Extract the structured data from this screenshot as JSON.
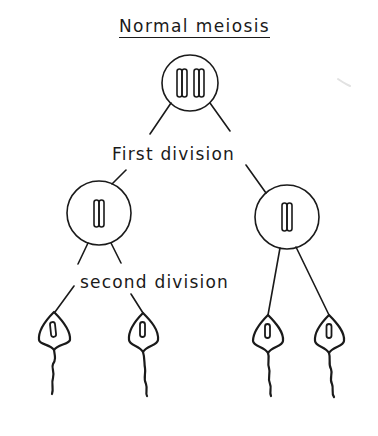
{
  "title": "Normal meiosis",
  "labels": {
    "first_division": "First division",
    "second_division": "second division"
  },
  "nodes": [
    {
      "id": "parent-cell",
      "stage": "before meiosis",
      "chromosome_pairs": 2,
      "cx": 190,
      "cy": 83,
      "r": 28
    },
    {
      "id": "daughter-cell-left",
      "stage": "after first division",
      "chromosome_pairs": 1,
      "cx": 99,
      "cy": 213,
      "r": 32
    },
    {
      "id": "daughter-cell-right",
      "stage": "after first division",
      "chromosome_pairs": 1,
      "cx": 287,
      "cy": 217,
      "r": 32
    }
  ],
  "gametes": [
    {
      "id": "sperm-1",
      "tip_x": 54,
      "tip_y": 312
    },
    {
      "id": "sperm-2",
      "tip_x": 143,
      "tip_y": 313
    },
    {
      "id": "sperm-3",
      "tip_x": 268,
      "tip_y": 315
    },
    {
      "id": "sperm-4",
      "tip_x": 329,
      "tip_y": 315
    }
  ],
  "colors": {
    "ink": "#1a1a1a",
    "background": "#ffffff"
  }
}
